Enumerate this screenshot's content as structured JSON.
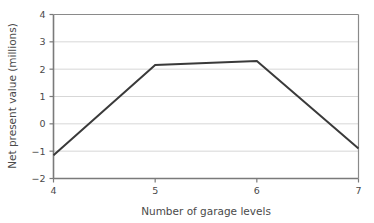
{
  "chart_data": {
    "type": "line",
    "title": "",
    "xlabel": "Number of garage levels",
    "ylabel": "Net present value (millions)",
    "x": [
      4,
      5,
      6,
      7
    ],
    "y": [
      -1.15,
      2.15,
      2.3,
      -0.9
    ],
    "series": [
      {
        "name": "Net present value",
        "x": [
          4,
          5,
          6,
          7
        ],
        "values": [
          -1.15,
          2.15,
          2.3,
          -0.9
        ]
      }
    ],
    "xlim": [
      4,
      7
    ],
    "ylim": [
      -2,
      4
    ],
    "xticks": [
      "4",
      "5",
      "6",
      "7"
    ],
    "xtick_values": [
      4,
      5,
      6,
      7
    ],
    "yticks": [
      "4",
      "3",
      "2",
      "1",
      "0",
      "-1",
      "-2"
    ],
    "ytick_values": [
      4,
      3,
      2,
      1,
      0,
      -1,
      -2
    ],
    "grid": "horizontal",
    "legend": "none",
    "line_color": "#3a3a3a",
    "grid_color": "#d7d7d7",
    "axis_color": "#7a7a7a",
    "background_color": "#ffffff"
  }
}
